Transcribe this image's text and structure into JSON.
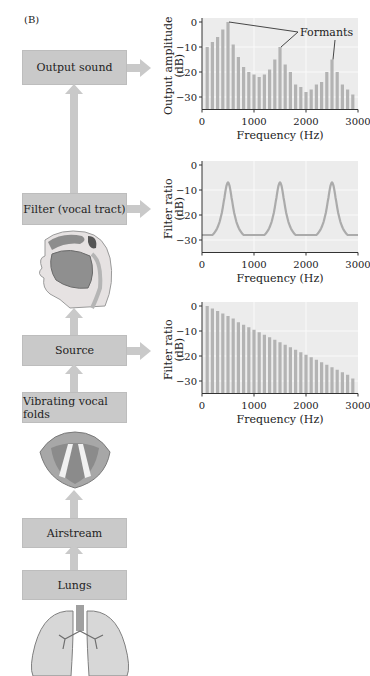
{
  "panel_label": "(B)",
  "boxes": {
    "output_sound": "Output sound",
    "filter": "Filter (vocal tract)",
    "source": "Source",
    "vibrating": "Vibrating vocal folds",
    "airstream": "Airstream",
    "lungs": "Lungs"
  },
  "illustrations": {
    "head": "vocal-tract-sagittal-section",
    "larynx": "vocal-folds",
    "lungs": "lungs"
  },
  "colors": {
    "box": "#c9c9c9",
    "plot_bg": "#ececec",
    "bar": "#b3b3b3",
    "curve": "#ababab"
  },
  "chart_data": [
    {
      "type": "bar",
      "ylabel": "Output amplitude (dB)",
      "xlabel": "Frequency (Hz)",
      "annotation": "Formants",
      "annotation_targets_hz": [
        500,
        1500,
        2500
      ],
      "xlim": [
        0,
        3000
      ],
      "ylim": [
        -35,
        0
      ],
      "xticks": [
        0,
        1000,
        2000,
        3000
      ],
      "yticks": [
        0,
        -10,
        -20,
        -30
      ],
      "ytick_labels": [
        "0",
        "−10",
        "−20",
        "−30"
      ],
      "grid": true,
      "x": [
        100,
        200,
        300,
        400,
        500,
        600,
        700,
        800,
        900,
        1000,
        1100,
        1200,
        1300,
        1400,
        1500,
        1600,
        1700,
        1800,
        1900,
        2000,
        2100,
        2200,
        2300,
        2400,
        2500,
        2600,
        2700,
        2800,
        2900
      ],
      "values": [
        -10,
        -8,
        -6,
        -3,
        0,
        -9,
        -14,
        -18,
        -20,
        -21,
        -22,
        -21,
        -19,
        -15,
        -10,
        -17,
        -20,
        -25,
        -26,
        -28,
        -27,
        -25,
        -24,
        -20,
        -15,
        -20,
        -25,
        -27,
        -29
      ]
    },
    {
      "type": "line",
      "ylabel": "Filter ratio (dB)",
      "xlabel": "Frequency (Hz)",
      "xlim": [
        0,
        3000
      ],
      "ylim": [
        -35,
        0
      ],
      "xticks": [
        0,
        1000,
        2000,
        3000
      ],
      "yticks": [
        0,
        -10,
        -20,
        -30
      ],
      "ytick_labels": [
        "0",
        "−10",
        "−20",
        "−30"
      ],
      "grid": true,
      "peaks_hz": [
        500,
        1500,
        2500
      ],
      "peak_db": -7,
      "trough_db": -28
    },
    {
      "type": "bar",
      "ylabel": "Filter ratio (dB)",
      "xlabel": "Frequency (Hz)",
      "xlim": [
        0,
        3000
      ],
      "ylim": [
        -35,
        0
      ],
      "xticks": [
        0,
        1000,
        2000,
        3000
      ],
      "yticks": [
        0,
        -10,
        -20,
        -30
      ],
      "ytick_labels": [
        "0",
        "−10",
        "−20",
        "−30"
      ],
      "grid": true,
      "x": [
        100,
        200,
        300,
        400,
        500,
        600,
        700,
        800,
        900,
        1000,
        1100,
        1200,
        1300,
        1400,
        1500,
        1600,
        1700,
        1800,
        1900,
        2000,
        2100,
        2200,
        2300,
        2400,
        2500,
        2600,
        2700,
        2800,
        2900
      ],
      "values": [
        0,
        -1,
        -2,
        -3,
        -4,
        -5,
        -6.5,
        -7.5,
        -8.5,
        -9.5,
        -10.5,
        -11.5,
        -12.5,
        -13.5,
        -14.5,
        -15.5,
        -16.5,
        -17.5,
        -18.5,
        -19.5,
        -20.5,
        -21.5,
        -22.5,
        -23.5,
        -24.5,
        -25.5,
        -26.5,
        -27.5,
        -29
      ]
    }
  ]
}
